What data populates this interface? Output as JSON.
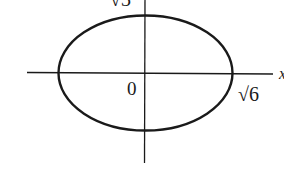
{
  "figure": {
    "type": "ellipse-on-axes",
    "equation_implied": "x^2/6 + y^2/3 = 1",
    "colors": {
      "stroke": "#1a1a1a",
      "background": "#ffffff"
    },
    "labels": {
      "origin": "0",
      "x_intercept": "√6",
      "y_intercept": "√3",
      "x_axis": "x"
    }
  }
}
